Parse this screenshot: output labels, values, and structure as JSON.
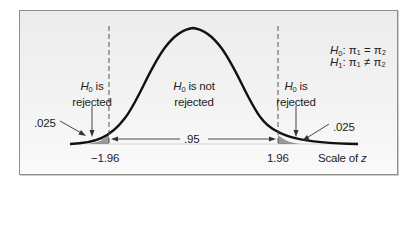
{
  "diagram": {
    "type": "two-tailed-hypothesis-test",
    "hypotheses": {
      "null": {
        "symbol": "H",
        "subscript": "0",
        "statement": ": π₁ = π₂"
      },
      "alternative": {
        "symbol": "H",
        "subscript": "1",
        "statement": ": π₁ ≠ π₂"
      }
    },
    "regions": {
      "left_reject": {
        "symbol": "H",
        "subscript": "0",
        "line1": " is",
        "line2": "rejected"
      },
      "middle_accept": {
        "symbol": "H",
        "subscript": "0",
        "line1": " is not",
        "line2": "rejected"
      },
      "right_reject": {
        "symbol": "H",
        "subscript": "0",
        "line1": " is",
        "line2": "rejected"
      }
    },
    "tail_areas": {
      "left": ".025",
      "right": ".025"
    },
    "center_area": ".95",
    "critical_values": {
      "left": "−1.96",
      "right": "1.96"
    },
    "axis_label_prefix": "Scale of ",
    "axis_label_var": "z",
    "colors": {
      "curve": "#111111",
      "shade": "#9a9a9a",
      "dashed": "#555555",
      "frame": "#8e8e8e"
    }
  }
}
